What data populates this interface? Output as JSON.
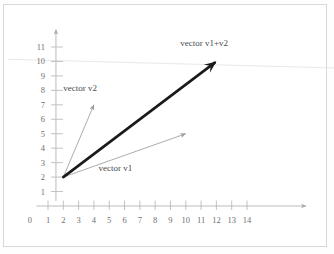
{
  "figure": {
    "background_color": "#ffffff",
    "border_color": "#d8d8d8",
    "axis_color": "#b0b0b0",
    "tick_color": "#b8b8b8",
    "label_color": "#6f6f6f",
    "thin_vector_color": "#a8a8a8",
    "thick_vector_color": "#1a1a1a",
    "artifact_line_color": "#e2e2e2"
  },
  "chart_data": {
    "type": "line",
    "title": "",
    "xlabel": "",
    "ylabel": "",
    "xlim": [
      0,
      15.2
    ],
    "ylim": [
      0,
      12.4
    ],
    "grid": false,
    "legend_position": "inline-annotations",
    "x_tick_labels": [
      "1",
      "2",
      "3",
      "4",
      "5",
      "6",
      "7",
      "8",
      "9",
      "10",
      "11",
      "12",
      "13",
      "14"
    ],
    "x_tick_values": [
      1,
      2,
      3,
      4,
      5,
      6,
      7,
      8,
      9,
      10,
      11,
      12,
      13,
      14
    ],
    "y_tick_labels": [
      "0",
      "1",
      "2",
      "3",
      "4",
      "5",
      "6",
      "7",
      "8",
      "9",
      "10",
      "11"
    ],
    "y_tick_values": [
      0,
      1,
      2,
      3,
      4,
      5,
      6,
      7,
      8,
      9,
      10,
      11
    ],
    "origin_label": "0",
    "vectors": [
      {
        "name": "vector v2",
        "label": "vector v2",
        "tail": [
          2,
          2
        ],
        "head": [
          4,
          7
        ],
        "components": [
          2,
          5
        ],
        "style": "thin",
        "color": "#a8a8a8",
        "label_x": 3.1,
        "label_y": 7.95
      },
      {
        "name": "vector v1",
        "label": "vector v1",
        "tail": [
          2,
          2
        ],
        "head": [
          10,
          5
        ],
        "components": [
          8,
          3
        ],
        "style": "thin",
        "color": "#a8a8a8",
        "label_x": 5.4,
        "label_y": 2.45
      },
      {
        "name": "vector v1+v2",
        "label": "vector v1+v2",
        "tail": [
          2,
          2
        ],
        "head": [
          12,
          10
        ],
        "components": [
          10,
          8
        ],
        "style": "thick",
        "color": "#1a1a1a",
        "label_x": 11.2,
        "label_y": 11.05
      }
    ],
    "artifact_lines": [
      {
        "name": "scan-artifact-line",
        "y_start": 10.15,
        "y_end": 9.55
      }
    ],
    "axes": [
      {
        "name": "x-axis",
        "arrow": true,
        "direction": "right"
      },
      {
        "name": "y-axis",
        "arrow": true,
        "direction": "up"
      }
    ]
  }
}
